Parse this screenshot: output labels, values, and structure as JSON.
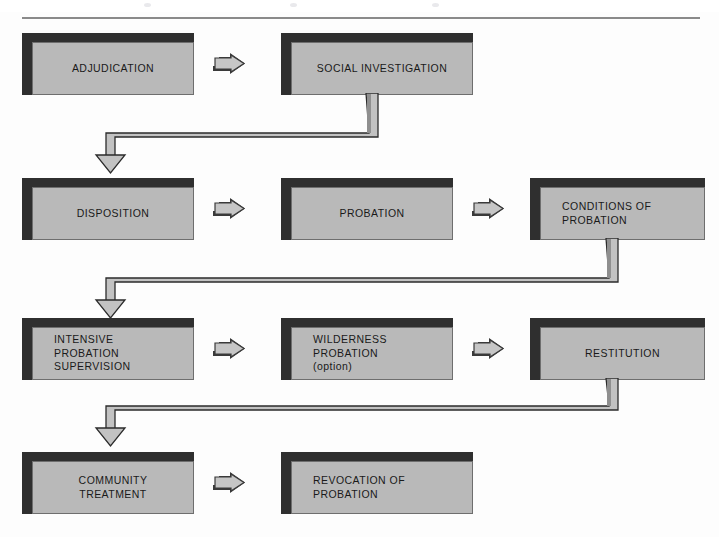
{
  "document": {
    "type": "flowchart",
    "title": "Juvenile Justice Probation Process Flowchart",
    "rule_color": "#8a8a8a",
    "box_face_color": "#b9b9b9",
    "box_shadow_color": "#2f2f2f",
    "text_color": "#1a1a1a"
  },
  "nodes": {
    "adjudication": {
      "label": "ADJUDICATION"
    },
    "social_investigation": {
      "label": "SOCIAL INVESTIGATION"
    },
    "disposition": {
      "label": "DISPOSITION"
    },
    "probation": {
      "label": "PROBATION"
    },
    "conditions": {
      "label": "CONDITIONS OF\nPROBATION"
    },
    "intensive": {
      "label": "INTENSIVE\nPROBATION\nSUPERVISION"
    },
    "wilderness": {
      "label": "WILDERNESS\nPROBATION\n(option)"
    },
    "restitution": {
      "label": "RESTITUTION"
    },
    "community": {
      "label": "COMMUNITY\nTREATMENT"
    },
    "revocation": {
      "label": "REVOCATION OF\nPROBATION"
    }
  },
  "rows": [
    {
      "name": "row-1",
      "nodes": [
        "adjudication",
        "social_investigation"
      ]
    },
    {
      "name": "row-2",
      "nodes": [
        "disposition",
        "probation",
        "conditions"
      ]
    },
    {
      "name": "row-3",
      "nodes": [
        "intensive",
        "wilderness",
        "restitution"
      ]
    },
    {
      "name": "row-4",
      "nodes": [
        "community",
        "revocation"
      ]
    }
  ],
  "arrows": {
    "icon": "right-block-arrow",
    "inline": [
      {
        "from": "adjudication",
        "to": "social_investigation"
      },
      {
        "from": "disposition",
        "to": "probation"
      },
      {
        "from": "probation",
        "to": "conditions"
      },
      {
        "from": "intensive",
        "to": "wilderness"
      },
      {
        "from": "wilderness",
        "to": "restitution"
      },
      {
        "from": "community",
        "to": "revocation"
      }
    ],
    "wrap": [
      {
        "icon": "ribbon-connector-down-left-down",
        "from": "social_investigation",
        "to": "disposition"
      },
      {
        "icon": "ribbon-connector-down-left-down",
        "from": "conditions",
        "to": "intensive"
      },
      {
        "icon": "ribbon-connector-down-left-down",
        "from": "restitution",
        "to": "community"
      }
    ]
  }
}
